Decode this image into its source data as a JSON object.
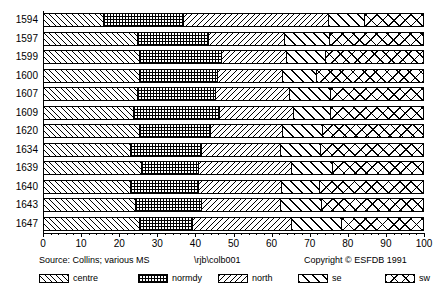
{
  "chart_data": {
    "type": "bar",
    "orientation": "horizontal",
    "stacked": true,
    "normalized_percent": true,
    "title": "",
    "subtitle": "",
    "xlabel": "",
    "ylabel": "",
    "xlim": [
      0,
      100
    ],
    "xticks": [
      0,
      10,
      20,
      30,
      40,
      50,
      60,
      70,
      80,
      90,
      100
    ],
    "xtick_labels": [
      "0",
      "10",
      "20",
      "30",
      "40",
      "50",
      "60",
      "70",
      "80",
      "90",
      "100"
    ],
    "grid": false,
    "legend_position": "bottom",
    "categories": [
      "1594",
      "1597",
      "1599",
      "1600",
      "1607",
      "1609",
      "1620",
      "1634",
      "1639",
      "1640",
      "1643",
      "1647"
    ],
    "series": [
      {
        "name": "centre",
        "values": [
          16.0,
          25.0,
          25.5,
          25.5,
          25.0,
          24.0,
          25.5,
          23.0,
          26.0,
          23.0,
          24.4,
          25.5
        ]
      },
      {
        "name": "normdy",
        "values": [
          21.0,
          18.5,
          21.5,
          20.5,
          20.4,
          22.4,
          18.5,
          18.7,
          15.0,
          18.0,
          17.3,
          13.9
        ]
      },
      {
        "name": "north",
        "values": [
          38.0,
          20.0,
          17.0,
          17.0,
          19.4,
          19.6,
          19.0,
          20.8,
          24.4,
          21.7,
          20.8,
          26.0
        ]
      },
      {
        "name": "se",
        "values": [
          9.5,
          11.8,
          10.3,
          9.0,
          10.8,
          9.6,
          10.4,
          10.5,
          10.6,
          10.0,
          10.7,
          13.1
        ]
      },
      {
        "name": "sw",
        "values": [
          15.5,
          24.7,
          25.7,
          28.0,
          24.4,
          24.4,
          26.6,
          27.0,
          24.0,
          27.3,
          26.8,
          21.5
        ]
      }
    ],
    "legend_entries": [
      "centre",
      "normdy",
      "north",
      "se",
      "sw"
    ],
    "annotations": {
      "source": "Source: Collins; various MS",
      "file": "\\rjb\\colb001",
      "copyright": "Copyright © ESFDB 1991"
    }
  },
  "footer": {
    "source": "Source: Collins; various MS",
    "file": "\\rjb\\colb001",
    "copyright": "Copyright © ESFDB 1991"
  },
  "legend": {
    "items": [
      {
        "label": "centre",
        "pattern": "diagonal-up-thin"
      },
      {
        "label": "normdy",
        "pattern": "crosshatch-grid"
      },
      {
        "label": "north",
        "pattern": "diagonal-down-thin"
      },
      {
        "label": "se",
        "pattern": "diagonal-up-bold"
      },
      {
        "label": "sw",
        "pattern": "diagonal-cross-bold"
      }
    ]
  },
  "colors": {
    "ink": "#000000",
    "paper": "#ffffff"
  }
}
